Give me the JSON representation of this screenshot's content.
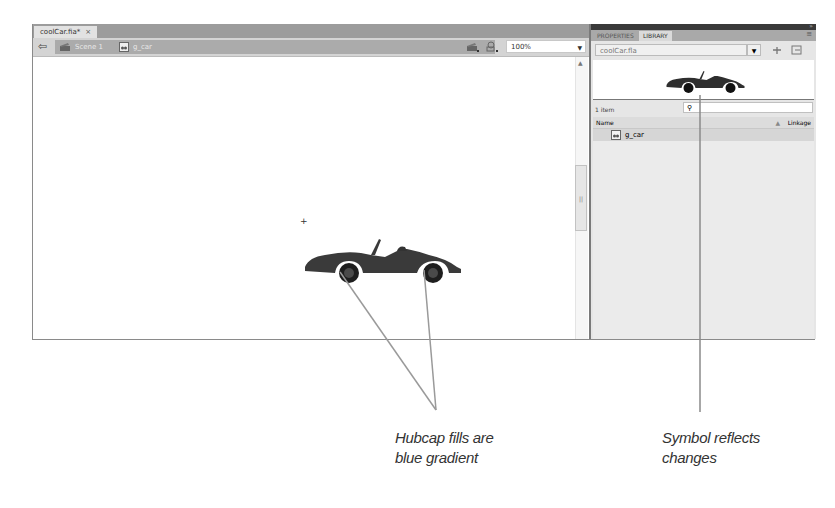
{
  "document_tab": {
    "title": "coolCar.fia*",
    "close_glyph": "×"
  },
  "edit_bar": {
    "back_glyph": "⇦",
    "breadcrumbs": [
      {
        "label": "Scene 1",
        "icon": "clapper-icon"
      },
      {
        "label": "g_car",
        "icon": "graphic-symbol-icon"
      }
    ],
    "zoom": {
      "value": "100%",
      "dropdown_glyph": "▼"
    }
  },
  "panel": {
    "tabs": [
      {
        "label": "PROPERTIES",
        "active": false
      },
      {
        "label": "LIBRARY",
        "active": true
      }
    ],
    "library_select": "coolCar.fla",
    "dropdown_glyph": "▼",
    "item_count": "1 item",
    "search_glyph": "⚲",
    "columns": {
      "name": "Name",
      "linkage": "Linkage",
      "sort_glyph": "▲"
    },
    "items": [
      {
        "name": "g_car",
        "icon": "graphic-symbol-icon"
      }
    ]
  },
  "annotations": [
    {
      "line1": "Hubcap fills are",
      "line2": "blue gradient"
    },
    {
      "line1": "Symbol reflects",
      "line2": "changes"
    }
  ],
  "colors": {
    "annotation_line": "#9a9a9a",
    "car_body": "#3a3a3a"
  }
}
